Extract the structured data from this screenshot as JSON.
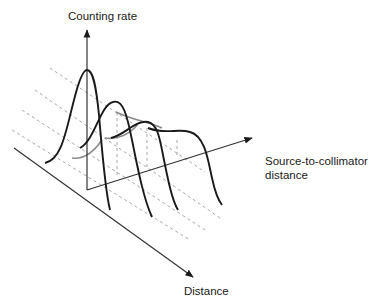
{
  "diagram": {
    "type": "3d-profile-diagram",
    "axes": {
      "vertical": {
        "label": "Counting rate"
      },
      "depth": {
        "label_line1": "Source-to-collimator",
        "label_line2": "distance"
      },
      "horizontal": {
        "label": "Distance"
      }
    },
    "profiles": [
      {
        "name": "profile-1",
        "description": "tall narrow peak (closest to collimator)"
      },
      {
        "name": "profile-2",
        "description": "lower, wider peak"
      },
      {
        "name": "profile-3",
        "description": "lower, wider peak"
      },
      {
        "name": "profile-4",
        "description": "broad flattened plateau (farthest)"
      }
    ],
    "colors": {
      "curve": "#1a1a1a",
      "axis": "#333333",
      "guide_dashed": "#a8a8a8",
      "back_curve": "#8c8c8c"
    }
  }
}
